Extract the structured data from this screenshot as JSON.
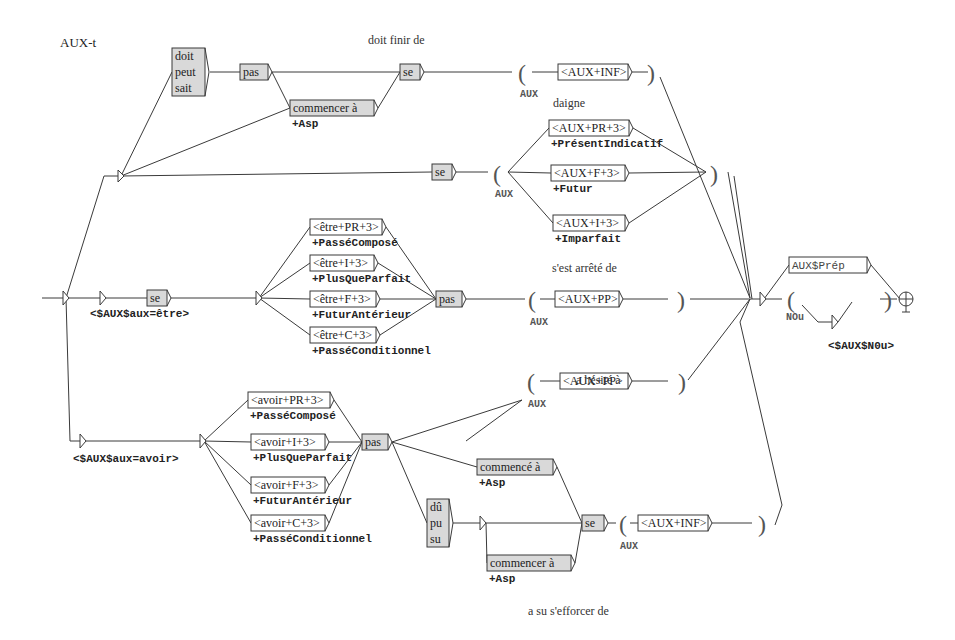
{
  "graph": {
    "title": "AUX-t",
    "comments": [
      {
        "id": "c1",
        "text": "doit finir de",
        "x": 368,
        "y": 44
      },
      {
        "id": "c2",
        "text": "daigne",
        "x": 553,
        "y": 107
      },
      {
        "id": "c3",
        "text": "s'est arrêté de",
        "x": 552,
        "y": 272
      },
      {
        "id": "c4",
        "text": "a hésité à",
        "x": 576,
        "y": 384
      },
      {
        "id": "c5",
        "text": "a su s'efforcer de",
        "x": 528,
        "y": 615
      }
    ],
    "boxes": [
      {
        "id": "b-doit",
        "lines": [
          "doit",
          "peut",
          "sait"
        ],
        "x": 172,
        "y": 48,
        "w": 33,
        "h": 48,
        "gray": true
      },
      {
        "id": "b-pas1",
        "lines": [
          "pas"
        ],
        "x": 240,
        "y": 64,
        "w": 28,
        "h": 16,
        "gray": true
      },
      {
        "id": "b-commencer1",
        "lines": [
          "commencer à"
        ],
        "x": 290,
        "y": 100,
        "w": 84,
        "h": 16,
        "gray": true,
        "output": "+Asp"
      },
      {
        "id": "b-se1",
        "lines": [
          "se"
        ],
        "x": 400,
        "y": 64,
        "w": 20,
        "h": 16,
        "gray": true
      },
      {
        "id": "b-auxinf1",
        "lines": [
          "<AUX+INF>"
        ],
        "x": 558,
        "y": 64,
        "w": 70,
        "h": 16,
        "gray": false
      },
      {
        "id": "b-se2",
        "lines": [
          "se"
        ],
        "x": 432,
        "y": 164,
        "w": 20,
        "h": 16,
        "gray": true
      },
      {
        "id": "b-auxpr",
        "lines": [
          "<AUX+PR+3>"
        ],
        "x": 549,
        "y": 120,
        "w": 80,
        "h": 16,
        "gray": false,
        "output": "+PrésentIndicatif"
      },
      {
        "id": "b-auxf",
        "lines": [
          "<AUX+F+3>"
        ],
        "x": 551,
        "y": 165,
        "w": 74,
        "h": 16,
        "gray": false,
        "output": "+Futur"
      },
      {
        "id": "b-auxi",
        "lines": [
          "<AUX+I+3>"
        ],
        "x": 553,
        "y": 215,
        "w": 72,
        "h": 16,
        "gray": false,
        "output": "+Imparfait"
      },
      {
        "id": "b-se3",
        "lines": [
          "se"
        ],
        "x": 147,
        "y": 290,
        "w": 20,
        "h": 16,
        "gray": true
      },
      {
        "id": "b-etrepr",
        "lines": [
          "<être+PR+3>"
        ],
        "x": 310,
        "y": 219,
        "w": 72,
        "h": 16,
        "gray": false,
        "output": "+PasséComposé"
      },
      {
        "id": "b-etrei",
        "lines": [
          "<être+I+3>"
        ],
        "x": 310,
        "y": 255,
        "w": 64,
        "h": 16,
        "gray": false,
        "output": "+PlusQueParfait"
      },
      {
        "id": "b-etref",
        "lines": [
          "<être+F+3>"
        ],
        "x": 310,
        "y": 291,
        "w": 66,
        "h": 16,
        "gray": false,
        "output": "+FuturAntérieur"
      },
      {
        "id": "b-etrec",
        "lines": [
          "<être+C+3>"
        ],
        "x": 310,
        "y": 327,
        "w": 66,
        "h": 16,
        "gray": false,
        "output": "+PasséConditionnel"
      },
      {
        "id": "b-pas2",
        "lines": [
          "pas"
        ],
        "x": 436,
        "y": 291,
        "w": 26,
        "h": 16,
        "gray": true
      },
      {
        "id": "b-auxpp1",
        "lines": [
          "<AUX+PP>"
        ],
        "x": 555,
        "y": 291,
        "w": 64,
        "h": 16,
        "gray": false
      },
      {
        "id": "b-auxprep",
        "lines": [
          "AUX$Prép"
        ],
        "x": 789,
        "y": 257,
        "w": 78,
        "h": 16,
        "gray": false,
        "mono": true
      },
      {
        "id": "b-auxpp2",
        "lines": [
          "<AUX+PP>"
        ],
        "x": 560,
        "y": 373,
        "w": 68,
        "h": 16,
        "gray": false
      },
      {
        "id": "b-avoirpr",
        "lines": [
          "<avoir+PR+3>"
        ],
        "x": 248,
        "y": 392,
        "w": 82,
        "h": 16,
        "gray": false,
        "output": "+PasséComposé"
      },
      {
        "id": "b-avoiri",
        "lines": [
          "<avoir+I+3>"
        ],
        "x": 251,
        "y": 434,
        "w": 74,
        "h": 16,
        "gray": false,
        "output": "+PlusQueParfait"
      },
      {
        "id": "b-avoirf",
        "lines": [
          "<avoir+F+3>"
        ],
        "x": 251,
        "y": 477,
        "w": 74,
        "h": 16,
        "gray": false,
        "output": "+FuturAntérieur"
      },
      {
        "id": "b-avoirc",
        "lines": [
          "<avoir+C+3>"
        ],
        "x": 251,
        "y": 515,
        "w": 74,
        "h": 16,
        "gray": false,
        "output": "+PasséConditionnel"
      },
      {
        "id": "b-pas3",
        "lines": [
          "pas"
        ],
        "x": 362,
        "y": 434,
        "w": 26,
        "h": 16,
        "gray": true
      },
      {
        "id": "b-commence",
        "lines": [
          "commencé à"
        ],
        "x": 477,
        "y": 459,
        "w": 76,
        "h": 16,
        "gray": true,
        "output": "+Asp"
      },
      {
        "id": "b-du",
        "lines": [
          "dû",
          "pu",
          "su"
        ],
        "x": 427,
        "y": 499,
        "w": 22,
        "h": 48,
        "gray": true
      },
      {
        "id": "b-commencer2",
        "lines": [
          "commencer à"
        ],
        "x": 487,
        "y": 555,
        "w": 84,
        "h": 16,
        "gray": true,
        "output": "+Asp"
      },
      {
        "id": "b-se4",
        "lines": [
          "se"
        ],
        "x": 582,
        "y": 515,
        "w": 22,
        "h": 16,
        "gray": true
      },
      {
        "id": "b-auxinf2",
        "lines": [
          "<AUX+INF>"
        ],
        "x": 638,
        "y": 515,
        "w": 70,
        "h": 16,
        "gray": false
      }
    ],
    "variables": [
      {
        "id": "v1",
        "name": "AUX",
        "x": 520,
        "y": 97
      },
      {
        "id": "v2",
        "name": "AUX",
        "x": 495,
        "y": 197
      },
      {
        "id": "v3",
        "name": "AUX",
        "x": 530,
        "y": 325
      },
      {
        "id": "v4",
        "name": "AUX",
        "x": 528,
        "y": 407
      },
      {
        "id": "v5",
        "name": "NOu",
        "x": 786,
        "y": 320
      },
      {
        "id": "v6",
        "name": "AUX",
        "x": 620,
        "y": 549
      }
    ],
    "parens": [
      {
        "id": "p1o",
        "ch": "(",
        "x": 518,
        "y": 81
      },
      {
        "id": "p1c",
        "ch": ")",
        "x": 647,
        "y": 81
      },
      {
        "id": "p2o",
        "ch": "(",
        "x": 493,
        "y": 182
      },
      {
        "id": "p2c",
        "ch": ")",
        "x": 710,
        "y": 182
      },
      {
        "id": "p3o",
        "ch": "(",
        "x": 528,
        "y": 308
      },
      {
        "id": "p3c",
        "ch": ")",
        "x": 677,
        "y": 308
      },
      {
        "id": "p4o",
        "ch": "(",
        "x": 787,
        "y": 308
      },
      {
        "id": "p4c",
        "ch": ")",
        "x": 884,
        "y": 308
      },
      {
        "id": "p5o",
        "ch": "(",
        "x": 527,
        "y": 390
      },
      {
        "id": "p5c",
        "ch": ")",
        "x": 678,
        "y": 390
      },
      {
        "id": "p6o",
        "ch": "(",
        "x": 619,
        "y": 532
      },
      {
        "id": "p6c",
        "ch": ")",
        "x": 758,
        "y": 532
      }
    ],
    "labels": [
      {
        "id": "l-aux-etre",
        "text": "<$AUX$aux=être>",
        "x": 90,
        "y": 317
      },
      {
        "id": "l-aux-avoir",
        "text": "<$AUX$aux=avoir>",
        "x": 73,
        "y": 462
      },
      {
        "id": "l-aux-nou",
        "text": "<$AUX$N0u>",
        "x": 828,
        "y": 349
      }
    ]
  }
}
